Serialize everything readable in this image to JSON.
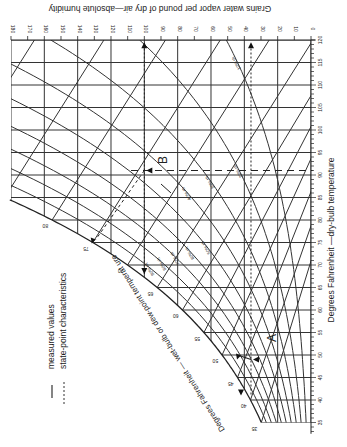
{
  "chart_data": {
    "type": "line",
    "orientation": "rotated 90° (dry-bulb temperature runs vertically, humidity ratio horizontally)",
    "xlabel": "Degrees Fahrenheit —dry-bulb temperature",
    "ylabel": "Grains water vapor per pound of dry air—absolute humidity",
    "curve_label": "Degrees Fahrenheit — wet-bulb or dew-point temperat ure",
    "dry_bulb_ticks": [
      35,
      40,
      45,
      50,
      55,
      60,
      65,
      70,
      75,
      80,
      85,
      90,
      95,
      100,
      105,
      110,
      115,
      120
    ],
    "dry_bulb_range": [
      35,
      120
    ],
    "humidity_ticks": [
      0,
      10,
      20,
      30,
      40,
      50,
      60,
      70,
      80,
      90,
      100,
      110,
      120,
      130,
      140,
      150,
      160,
      170,
      180
    ],
    "humidity_range": [
      0,
      180
    ],
    "grid": true,
    "saturation_labels": [
      35,
      40,
      45,
      50,
      55,
      60,
      65,
      70,
      75,
      80,
      90
    ],
    "rh_curves": [
      {
        "label": "10% rh",
        "rh": 10
      },
      {
        "label": "20% rh",
        "rh": 20
      },
      {
        "label": "30% rh",
        "rh": 30
      },
      {
        "label": "40% rh",
        "rh": 40
      },
      {
        "label": "50% rh",
        "rh": 50
      },
      {
        "label": "60% rh",
        "rh": 60
      },
      {
        "label": "70% rh",
        "rh": 70
      },
      {
        "label": "80% rh",
        "rh": 80
      },
      {
        "label": "90% rh",
        "rh": 90
      }
    ],
    "points": [
      {
        "name": "A",
        "dry_bulb": 49,
        "wet_bulb": 46,
        "humidity_grains": 36,
        "dew_point": 43
      },
      {
        "name": "B",
        "dry_bulb": 91,
        "wet_bulb": 75,
        "humidity_grains": 100,
        "dew_point": 66
      }
    ],
    "legend": [
      {
        "label": "measured values",
        "style": "long-dash"
      },
      {
        "label": "state-point characteristics",
        "style": "dotted"
      }
    ]
  },
  "legend": {
    "measured": "measured values",
    "state": "state-point characteristics"
  },
  "labels": {
    "top_axis": "Grains water vapor per pound of dry air—absolute humidity",
    "right_axis": "Degrees Fahrenheit —dry-bulb temperature",
    "curve_axis": "Degrees Fahrenheit — wet-bulb or dew-point temperat ure",
    "point_a": "A",
    "point_b": "B"
  }
}
